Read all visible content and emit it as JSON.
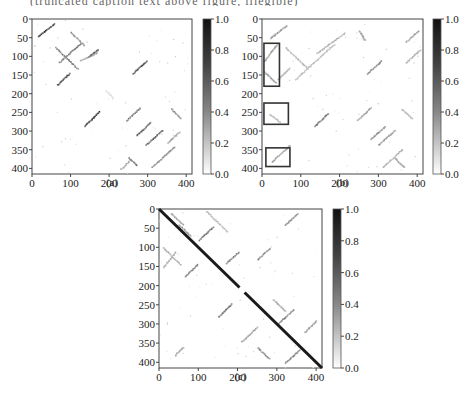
{
  "header": {
    "cut_text": "(truncated caption text above figure, illegible)"
  },
  "chart_data": [
    {
      "type": "heatmap",
      "panel": "(a)",
      "caption": "(a)",
      "x_ticks": [
        "0",
        "100",
        "200",
        "300",
        "400"
      ],
      "y_ticks": [
        "0",
        "50",
        "100",
        "150",
        "200",
        "250",
        "300",
        "350",
        "400"
      ],
      "xlim": [
        0,
        415
      ],
      "ylim": [
        415,
        0
      ],
      "colorbar": {
        "ticks": [
          "1.0",
          "0.8",
          "0.6",
          "0.4",
          "0.2",
          "0.0"
        ],
        "range": [
          0.0,
          1.0
        ],
        "cmap": "gray_r"
      },
      "description": "Sparse contact-style matrix with short anti-/diagonal streaks, no main diagonal"
    },
    {
      "type": "heatmap",
      "panel": "(b)",
      "caption": "(b)",
      "x_ticks": [
        "0",
        "100",
        "200",
        "300",
        "400"
      ],
      "y_ticks": [
        "0",
        "50",
        "100",
        "150",
        "200",
        "250",
        "300",
        "350",
        "400"
      ],
      "xlim": [
        0,
        415
      ],
      "ylim": [
        415,
        0
      ],
      "colorbar": {
        "ticks": [
          "1.0",
          "0.8",
          "0.6",
          "0.4",
          "0.2",
          "0.0"
        ],
        "range": [
          0.0,
          1.0
        ],
        "cmap": "gray_r"
      },
      "highlight_boxes": [
        {
          "x": [
            5,
            45
          ],
          "y": [
            65,
            180
          ]
        },
        {
          "x": [
            5,
            68
          ],
          "y": [
            225,
            282
          ]
        },
        {
          "x": [
            10,
            72
          ],
          "y": [
            345,
            395
          ]
        }
      ],
      "description": "Sparse matrix with lighter streaks; three rectangular highlight boxes near left edge"
    },
    {
      "type": "heatmap",
      "panel": "(c)",
      "caption": "(c)",
      "x_ticks": [
        "0",
        "100",
        "200",
        "300",
        "400"
      ],
      "y_ticks": [
        "0",
        "50",
        "100",
        "150",
        "200",
        "250",
        "300",
        "350",
        "400"
      ],
      "xlim": [
        0,
        415
      ],
      "ylim": [
        415,
        0
      ],
      "colorbar": {
        "ticks": [
          "1.0",
          "0.8",
          "0.6",
          "0.4",
          "0.2",
          "0.0"
        ],
        "range": [
          0.0,
          1.0
        ],
        "cmap": "gray_r"
      },
      "main_diagonal": {
        "value": 1.0,
        "gap": [
          205,
          218
        ]
      },
      "description": "Strong main diagonal (value 1.0) with sparse off-diagonal streaks"
    }
  ]
}
